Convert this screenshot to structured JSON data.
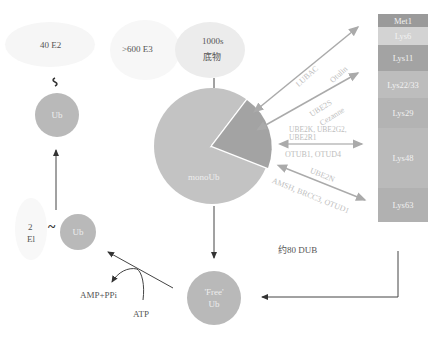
{
  "left_cycle": {
    "e2_label": "40 E2",
    "e3_label": ">600 E3",
    "e1_label_line1": "2",
    "e1_label_line2": "El",
    "thioester_symbol": "~",
    "ub_e1_label": "Ub",
    "ub_e2_label": "Ub",
    "free_ub_line1": "'Free'",
    "free_ub_line2": "Ub",
    "amp_label": "AMP+PPi",
    "atp_label": "ATP"
  },
  "substrates": {
    "line1": "1000s",
    "line2": "底物"
  },
  "pie": {
    "mono_label": "monoUb",
    "mono_fraction": 0.8,
    "poly_fraction": 0.2
  },
  "dub_label": "约80 DUB",
  "enzymes": [
    {
      "name": "LUBAC",
      "target": "Met1",
      "type": "E2/E3"
    },
    {
      "name": "Otulin",
      "target": "Met1",
      "type": "DUB"
    },
    {
      "name": "UBE2S",
      "target": "Lys11",
      "type": "E2"
    },
    {
      "name": "Cezanne",
      "target": "Lys11",
      "type": "DUB"
    },
    {
      "name": "UBE2K, UBE2G2, UBE2R1",
      "target": "Lys48",
      "type": "E2"
    },
    {
      "name": "OTUB1, OTUD4",
      "target": "Lys48",
      "type": "DUB"
    },
    {
      "name": "UBE2N",
      "target": "Lys63",
      "type": "E2"
    },
    {
      "name": "AMSH, BRCC3, OTUD1",
      "target": "Lys63",
      "type": "DUB"
    }
  ],
  "linkages": [
    {
      "label": "Met1",
      "height": 13,
      "color": "#9a9a9a"
    },
    {
      "label": "Lys6",
      "height": 18,
      "color": "#cfcfcf"
    },
    {
      "label": "Lys11",
      "height": 26,
      "color": "#a2a2a2"
    },
    {
      "label": "Lys22/33",
      "height": 27,
      "color": "#bdbdbd"
    },
    {
      "label": "Lys29",
      "height": 30,
      "color": "#b3b3b3"
    },
    {
      "label": "Lys48",
      "height": 60,
      "color": "#b9b9b9"
    },
    {
      "label": "Lys63",
      "height": 34,
      "color": "#b0b0b0"
    }
  ]
}
